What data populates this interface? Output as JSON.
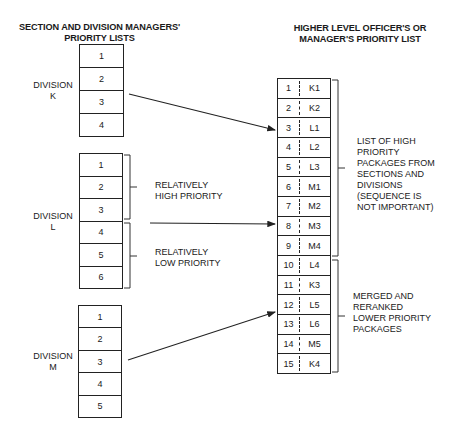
{
  "left_header": [
    "SECTION AND DIVISION MANAGERS'",
    "PRIORITY LISTS"
  ],
  "right_header": [
    "HIGHER LEVEL OFFICER'S OR",
    "MANAGER'S PRIORITY LIST"
  ],
  "divisions": [
    {
      "name": [
        "DIVISION",
        "K"
      ],
      "items": [
        "1",
        "2",
        "3",
        "4"
      ]
    },
    {
      "name": [
        "DIVISION",
        "L"
      ],
      "items": [
        "1",
        "2",
        "3",
        "4",
        "5",
        "6"
      ]
    },
    {
      "name": [
        "DIVISION",
        "M"
      ],
      "items": [
        "1",
        "2",
        "3",
        "4",
        "5"
      ]
    }
  ],
  "division_l_brackets": {
    "high": [
      "RELATIVELY",
      "HIGH PRIORITY"
    ],
    "low": [
      "RELATIVELY",
      "LOW PRIORITY"
    ]
  },
  "merged_list": [
    {
      "rank": "1",
      "pkg": "K1"
    },
    {
      "rank": "2",
      "pkg": "K2"
    },
    {
      "rank": "3",
      "pkg": "L1"
    },
    {
      "rank": "4",
      "pkg": "L2"
    },
    {
      "rank": "5",
      "pkg": "L3"
    },
    {
      "rank": "6",
      "pkg": "M1"
    },
    {
      "rank": "7",
      "pkg": "M2"
    },
    {
      "rank": "8",
      "pkg": "M3"
    },
    {
      "rank": "9",
      "pkg": "M4"
    },
    {
      "rank": "10",
      "pkg": "L4"
    },
    {
      "rank": "11",
      "pkg": "K3"
    },
    {
      "rank": "12",
      "pkg": "L5"
    },
    {
      "rank": "13",
      "pkg": "L6"
    },
    {
      "rank": "14",
      "pkg": "M5"
    },
    {
      "rank": "15",
      "pkg": "K4"
    }
  ],
  "right_brackets": {
    "high": [
      "LIST OF HIGH",
      "PRIORITY",
      "PACKAGES FROM",
      "SECTIONS AND",
      "DIVISIONS",
      "(SEQUENCE IS",
      "NOT IMPORTANT)"
    ],
    "low": [
      "MERGED AND",
      "RERANKED",
      "LOWER PRIORITY",
      "PACKAGES"
    ]
  }
}
